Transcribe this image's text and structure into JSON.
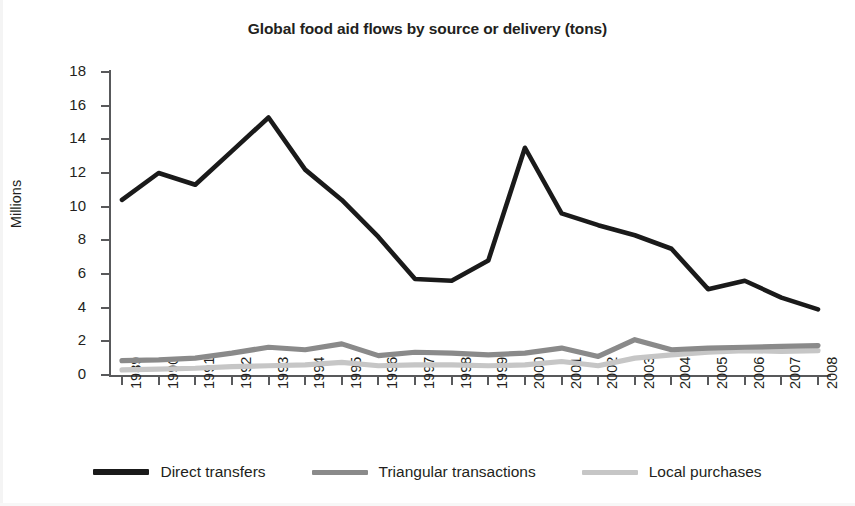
{
  "chart_data": {
    "type": "line",
    "title": "Global food aid flows by source or delivery (tons)",
    "xlabel": "",
    "ylabel": "Millions",
    "ylim": [
      0,
      18
    ],
    "yticks": [
      0,
      2,
      4,
      6,
      8,
      10,
      12,
      14,
      16,
      18
    ],
    "grid": false,
    "legend_position": "bottom",
    "categories": [
      "1989",
      "1990",
      "1991",
      "1992",
      "1993",
      "1994",
      "1995",
      "1996",
      "1997",
      "1998",
      "1999",
      "2000",
      "2001",
      "2002",
      "2003",
      "2004",
      "2005",
      "2006",
      "2007",
      "2008"
    ],
    "series": [
      {
        "name": "Direct transfers",
        "color": "#1a1a1a",
        "values": [
          10.4,
          12.0,
          11.3,
          13.3,
          15.3,
          12.2,
          10.4,
          8.2,
          5.7,
          5.6,
          6.8,
          13.5,
          9.6,
          8.9,
          8.3,
          7.5,
          5.1,
          5.6,
          4.6,
          3.9
        ]
      },
      {
        "name": "Triangular transactions",
        "color": "#8a8a8a",
        "values": [
          0.85,
          0.9,
          1.0,
          1.3,
          1.65,
          1.5,
          1.85,
          1.15,
          1.35,
          1.3,
          1.2,
          1.3,
          1.6,
          1.1,
          2.1,
          1.5,
          1.6,
          1.65,
          1.7,
          1.75
        ]
      },
      {
        "name": "Local purchases",
        "color": "#c6c6c6",
        "values": [
          0.3,
          0.35,
          0.4,
          0.5,
          0.55,
          0.6,
          0.75,
          0.55,
          0.6,
          0.6,
          0.55,
          0.6,
          0.8,
          0.55,
          1.0,
          1.2,
          1.35,
          1.45,
          1.4,
          1.45
        ]
      }
    ]
  },
  "axis": {
    "y_title": "Millions"
  },
  "legend": {
    "items": [
      {
        "label": "Direct transfers",
        "color": "#1a1a1a"
      },
      {
        "label": "Triangular transactions",
        "color": "#8a8a8a"
      },
      {
        "label": "Local purchases",
        "color": "#c6c6c6"
      }
    ]
  }
}
